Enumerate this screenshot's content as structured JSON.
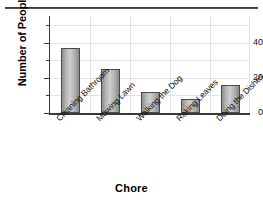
{
  "chart_data": {
    "type": "bar",
    "title": "",
    "xlabel": "Chore",
    "ylabel": "Number of People",
    "categories": [
      "Cleaning Bathroom",
      "Mowing Lawn",
      "Walking the Dog",
      "Raking Leaves",
      "Doing the Dishes"
    ],
    "values": [
      37,
      25,
      12,
      8,
      16
    ],
    "ylim": [
      0,
      55
    ],
    "y_major_ticks": [
      0,
      20,
      40
    ],
    "y_minor_ticks": [
      10,
      30,
      50
    ],
    "y_tick_labels": [
      "0",
      "20",
      "40"
    ],
    "grid": true,
    "legend": false,
    "bar_fill": "#c0c0c0",
    "bar_edge": "#4a4a4a",
    "grid_color": "#e2e2e2",
    "axis_color": "#3a3a3a"
  },
  "axes": {
    "y_title": "Number of People",
    "x_title": "Chore"
  }
}
